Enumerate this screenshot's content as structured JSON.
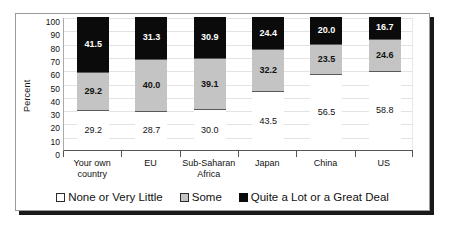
{
  "chart_data": {
    "type": "bar",
    "subtype": "stacked-bar-100",
    "title": "",
    "xlabel": "",
    "ylabel": "Percent",
    "ylim": [
      0,
      100
    ],
    "ytick_step": 10,
    "yticks": [
      100,
      90,
      80,
      70,
      60,
      50,
      40,
      30,
      20,
      10,
      0
    ],
    "grid": true,
    "legend_position": "bottom",
    "categories": [
      "Your own country",
      "EU",
      "Sub-Saharan Africa",
      "Japan",
      "China",
      "US"
    ],
    "category_lines": [
      [
        "Your own",
        "country"
      ],
      [
        "EU"
      ],
      [
        "Sub-Saharan",
        "Africa"
      ],
      [
        "Japan"
      ],
      [
        "China"
      ],
      [
        "US"
      ]
    ],
    "series": [
      {
        "name": "None or Very Little",
        "color": "#ffffff",
        "values": [
          29.2,
          28.7,
          30.0,
          43.5,
          56.5,
          58.8
        ],
        "labels": [
          "29.2",
          "28.7",
          "30.0",
          "43.5",
          "56.5",
          "58.8"
        ]
      },
      {
        "name": "Some",
        "color": "#c4c4c4",
        "values": [
          29.2,
          40.0,
          39.1,
          32.2,
          23.5,
          24.6
        ],
        "labels": [
          "29.2",
          "40.0",
          "39.1",
          "32.2",
          "23.5",
          "24.6"
        ]
      },
      {
        "name": "Quite a Lot or a Great Deal",
        "color": "#0b0b0b",
        "values": [
          41.5,
          31.3,
          30.9,
          24.4,
          20.0,
          16.7
        ],
        "labels": [
          "41.5",
          "31.3",
          "30.9",
          "24.4",
          "20.0",
          "16.7"
        ]
      }
    ]
  },
  "legend": {
    "items": [
      {
        "label": "None or Very Little",
        "swatch": "none"
      },
      {
        "label": "Some",
        "swatch": "some"
      },
      {
        "label": "Quite a Lot or a Great Deal",
        "swatch": "lot"
      }
    ]
  }
}
